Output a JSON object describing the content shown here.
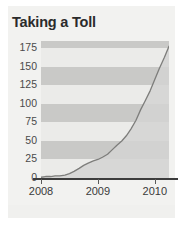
{
  "chart_data": {
    "type": "line",
    "title": "Taking a Toll",
    "xlabel": "",
    "ylabel": "",
    "ylim": [
      0,
      185
    ],
    "xlim": [
      2008.0,
      2010.25
    ],
    "grid": "horizontal-bands",
    "legend": "none",
    "y_ticks": [
      175,
      150,
      125,
      100,
      75,
      50,
      25,
      0
    ],
    "x_ticks": [
      2008,
      2009,
      2010
    ],
    "x_tick_labels": [
      "2008",
      "2009",
      "2010"
    ],
    "series": [
      {
        "name": "Cumulative total",
        "x": [
          2008.0,
          2008.08,
          2008.17,
          2008.25,
          2008.33,
          2008.42,
          2008.5,
          2008.58,
          2008.67,
          2008.75,
          2008.83,
          2008.92,
          2009.0,
          2009.08,
          2009.17,
          2009.25,
          2009.33,
          2009.42,
          2009.5,
          2009.58,
          2009.67,
          2009.75,
          2009.83,
          2009.92,
          2010.0,
          2010.08,
          2010.17,
          2010.25
        ],
        "values": [
          1,
          2,
          2,
          3,
          3,
          4,
          6,
          9,
          13,
          17,
          20,
          23,
          25,
          28,
          32,
          38,
          44,
          50,
          57,
          66,
          78,
          92,
          104,
          118,
          133,
          148,
          163,
          178
        ]
      }
    ]
  },
  "y_axis": {
    "ticks": [
      {
        "label": "175",
        "value": 175
      },
      {
        "label": "150",
        "value": 150
      },
      {
        "label": "125",
        "value": 125
      },
      {
        "label": "100",
        "value": 100
      },
      {
        "label": "75",
        "value": 75
      },
      {
        "label": "50",
        "value": 50
      },
      {
        "label": "25",
        "value": 25
      },
      {
        "label": "0",
        "value": 0
      }
    ]
  },
  "x_axis": {
    "ticks": [
      {
        "label": "2008",
        "value": 2008
      },
      {
        "label": "2009",
        "value": 2009
      },
      {
        "label": "2010",
        "value": 2010
      }
    ]
  },
  "colors": {
    "card_background": "#f2f2f0",
    "band_dark": "#c9c9c7",
    "band_light": "#ebebe9",
    "line": "#7d7d7b",
    "fill": "#d4d4d2",
    "axis": "#3c3c3c",
    "title_text": "#2b2b2b",
    "tick_text": "#4a4a4a"
  }
}
